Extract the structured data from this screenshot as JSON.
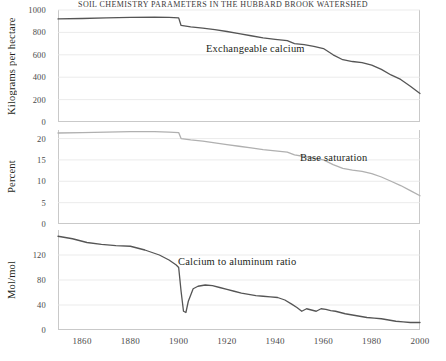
{
  "figure": {
    "title": "soil chemistry parameters in the Hubbard Brook watershed"
  },
  "chart_data": [
    {
      "type": "line",
      "title": "Exchangeable calcium",
      "xlabel": "",
      "ylabel": "Kilograms per hectare",
      "xlim": [
        1850,
        2000
      ],
      "ylim": [
        0,
        1000
      ],
      "xticks": [
        1860,
        1880,
        1900,
        1920,
        1940,
        1960,
        1980,
        2000
      ],
      "yticks": [
        0,
        200,
        400,
        600,
        800,
        1000
      ],
      "grid": "horizontal",
      "color": "#555555",
      "series": [
        {
          "name": "Exchangeable calcium",
          "x": [
            1850,
            1860,
            1870,
            1880,
            1890,
            1896,
            1900,
            1901,
            1905,
            1910,
            1915,
            1920,
            1925,
            1930,
            1935,
            1940,
            1945,
            1948,
            1952,
            1956,
            1960,
            1964,
            1968,
            1972,
            1976,
            1980,
            1984,
            1988,
            1992,
            1996,
            2000
          ],
          "values": [
            920,
            924,
            930,
            934,
            936,
            934,
            930,
            862,
            850,
            838,
            824,
            808,
            790,
            770,
            752,
            738,
            726,
            700,
            690,
            676,
            656,
            600,
            556,
            540,
            530,
            508,
            470,
            420,
            380,
            320,
            255
          ]
        }
      ]
    },
    {
      "type": "line",
      "title": "Base saturation",
      "xlabel": "",
      "ylabel": "Percent",
      "xlim": [
        1850,
        2000
      ],
      "ylim": [
        0,
        22
      ],
      "xticks": [
        1860,
        1880,
        1900,
        1920,
        1940,
        1960,
        1980,
        2000
      ],
      "yticks": [
        0,
        5,
        10,
        15,
        20
      ],
      "grid": "horizontal",
      "color": "#b0b0b0",
      "series": [
        {
          "name": "Base saturation",
          "x": [
            1850,
            1860,
            1870,
            1880,
            1890,
            1896,
            1900,
            1901,
            1905,
            1910,
            1915,
            1920,
            1925,
            1930,
            1935,
            1940,
            1945,
            1948,
            1952,
            1956,
            1960,
            1964,
            1968,
            1972,
            1976,
            1980,
            1984,
            1988,
            1992,
            1996,
            2000
          ],
          "values": [
            21.3,
            21.4,
            21.5,
            21.6,
            21.6,
            21.5,
            21.4,
            20.0,
            19.7,
            19.4,
            19.0,
            18.6,
            18.2,
            17.8,
            17.4,
            17.1,
            16.8,
            16.2,
            15.8,
            15.4,
            15.0,
            13.9,
            13.0,
            12.6,
            12.3,
            11.8,
            11.0,
            10.0,
            9.0,
            7.8,
            6.6
          ]
        }
      ]
    },
    {
      "type": "line",
      "title": "Calcium to aluminum ratio",
      "xlabel": "",
      "ylabel": "Mol/mol",
      "xlim": [
        1850,
        2000
      ],
      "ylim": [
        0,
        160
      ],
      "xticks": [
        1860,
        1880,
        1900,
        1920,
        1940,
        1960,
        1980,
        2000
      ],
      "yticks": [
        0,
        40,
        80,
        120
      ],
      "grid": "horizontal",
      "color": "#555555",
      "series": [
        {
          "name": "Calcium to aluminum ratio",
          "x": [
            1850,
            1856,
            1862,
            1868,
            1874,
            1880,
            1886,
            1892,
            1896,
            1899,
            1900,
            1901,
            1902,
            1903,
            1904,
            1906,
            1908,
            1911,
            1914,
            1917,
            1920,
            1923,
            1926,
            1929,
            1932,
            1935,
            1938,
            1941,
            1944,
            1947,
            1949,
            1951,
            1953,
            1955,
            1957,
            1959,
            1961,
            1963,
            1965,
            1967,
            1969,
            1972,
            1975,
            1978,
            1981,
            1984,
            1987,
            1990,
            1993,
            1996,
            2000
          ],
          "values": [
            150,
            146,
            140,
            137,
            135,
            134,
            128,
            120,
            112,
            104,
            100,
            62,
            30,
            28,
            46,
            66,
            70,
            72,
            71,
            68,
            65,
            62,
            59,
            57,
            55,
            54,
            53,
            52,
            48,
            41,
            36,
            30,
            34,
            32,
            30,
            34,
            33,
            31,
            30,
            28,
            26,
            24,
            22,
            20,
            19,
            18,
            16,
            14,
            13,
            12,
            12
          ]
        }
      ]
    }
  ]
}
